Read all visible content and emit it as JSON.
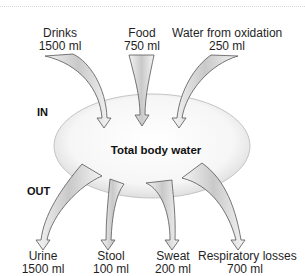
{
  "title": "Total body water",
  "sections": {
    "in_label": "IN",
    "out_label": "OUT"
  },
  "inputs": [
    {
      "name": "Drinks",
      "amount": "1500 ml"
    },
    {
      "name": "Food",
      "amount": "750 ml"
    },
    {
      "name": "Water from oxidation",
      "amount": "250 ml"
    }
  ],
  "outputs": [
    {
      "name": "Urine",
      "amount": "1500 ml"
    },
    {
      "name": "Stool",
      "amount": "100 ml"
    },
    {
      "name": "Sweat",
      "amount": "200 ml"
    },
    {
      "name": "Respiratory losses",
      "amount": "700 ml"
    }
  ],
  "colors": {
    "arrow_fill": "#d9d9d9",
    "arrow_stroke": "#555555",
    "ellipse_fill": "#f2f2f2",
    "ellipse_stroke": "#c8c8c8"
  }
}
